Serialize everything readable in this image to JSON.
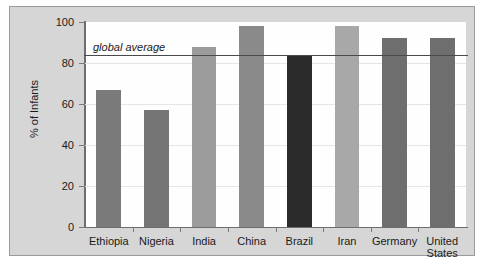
{
  "chart_data": {
    "type": "bar",
    "title": "",
    "subtitle": "",
    "xlabel": "",
    "ylabel": "% of Infants",
    "ylim": [
      0,
      100
    ],
    "yticks": [
      0,
      20,
      40,
      60,
      80,
      100
    ],
    "grid": true,
    "legend": "none",
    "categories": [
      "Ethiopia",
      "Nigeria",
      "India",
      "China",
      "Brazil",
      "Iran",
      "Germany",
      "United States"
    ],
    "values": [
      67,
      57,
      88,
      98,
      84,
      98,
      92,
      92
    ],
    "bar_colors": [
      "#7a7a7a",
      "#757575",
      "#9b9b9b",
      "#8a8a8a",
      "#2b2b2b",
      "#a8a8a8",
      "#6e6e6e",
      "#6e6e6e"
    ],
    "annotations": [
      {
        "name": "global-average",
        "label": "global average",
        "value": 84,
        "style": "italic"
      }
    ]
  },
  "axis": {
    "y_tick_labels": [
      "100",
      "80",
      "60",
      "40",
      "20",
      "0"
    ],
    "y_title": "% of Infants"
  },
  "x_labels": [
    {
      "line1": "Ethiopia",
      "line2": ""
    },
    {
      "line1": "Nigeria",
      "line2": ""
    },
    {
      "line1": "India",
      "line2": ""
    },
    {
      "line1": "China",
      "line2": ""
    },
    {
      "line1": "Brazil",
      "line2": ""
    },
    {
      "line1": "Iran",
      "line2": ""
    },
    {
      "line1": "Germany",
      "line2": ""
    },
    {
      "line1": "United",
      "line2": "States"
    }
  ],
  "colors": {
    "frame_background": "#d6d6d6",
    "plot_background": "#fefefe",
    "axis": "#6d6d6d",
    "gridline": "#e6e6e6",
    "average_line": "#4a4a4a",
    "text": "#1a1a1a"
  }
}
